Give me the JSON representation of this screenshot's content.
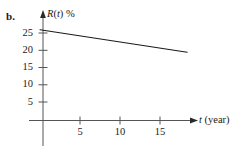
{
  "figure": {
    "part_label": "b.",
    "background_color": "#ffffff",
    "line_color": "#1a1a1a",
    "axis_color": "#555555",
    "width": 236,
    "height": 154
  },
  "chart_data": {
    "type": "line",
    "title": "",
    "subtitle": "",
    "xlabel": "t (year)",
    "xlabel_variable": "t",
    "xlabel_unit": "(year)",
    "ylabel": "R(t) %",
    "ylabel_variable": "R",
    "ylabel_arg": "t",
    "ylabel_unit": "%",
    "xlim": [
      0,
      19.5
    ],
    "ylim": [
      0,
      29
    ],
    "xticks": [
      5,
      10,
      15
    ],
    "xtick_labels": [
      "5",
      "10",
      "15"
    ],
    "yticks": [
      5,
      10,
      15,
      20,
      25
    ],
    "ytick_labels": [
      "5",
      "10",
      "15",
      "20",
      "25"
    ],
    "grid": false,
    "legend": "none",
    "series": [
      {
        "name": "R(t)",
        "x": [
          0,
          18.4
        ],
        "values": [
          26.3,
          19.8
        ],
        "style": "solid"
      }
    ],
    "annotations": []
  }
}
